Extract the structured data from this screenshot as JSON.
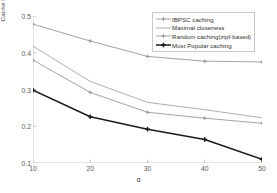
{
  "chart_data": {
    "type": "line",
    "title": "",
    "xlabel": "α",
    "ylabel": "Cache hit ratio",
    "x": [
      10,
      20,
      30,
      40,
      50
    ],
    "xticklabels": [
      "10",
      "20",
      "30",
      "40",
      "50"
    ],
    "yticklabels": [
      "0.1",
      "0.2",
      "0.3",
      "0.4",
      "0.5"
    ],
    "yticks": [
      0.1,
      0.2,
      0.3,
      0.4,
      0.5
    ],
    "xlim": [
      10,
      50
    ],
    "ylim": [
      0.1,
      0.5
    ],
    "grid": false,
    "legend_position": "top-right",
    "series": [
      {
        "name": "IBPSC caching",
        "values": [
          0.478,
          0.432,
          0.39,
          0.377,
          0.375
        ],
        "color": "#8c8c8c",
        "marker": "plus",
        "width": 0.8
      },
      {
        "name": "Maximal closeness",
        "values": [
          0.418,
          0.322,
          0.265,
          0.245,
          0.223
        ],
        "color": "#9a9a9a",
        "marker": "none",
        "width": 0.8
      },
      {
        "name": "Random caching(zipf-based)",
        "values": [
          0.38,
          0.292,
          0.238,
          0.222,
          0.208
        ],
        "color": "#8c8c8c",
        "marker": "plus",
        "width": 0.8
      },
      {
        "name": "Most Popular caching",
        "values": [
          0.298,
          0.226,
          0.192,
          0.164,
          0.11
        ],
        "color": "#1a1a1a",
        "marker": "plus",
        "width": 1.5
      }
    ]
  },
  "axis": {
    "line_color": "#bdbdbd",
    "tick_color": "#5a5a5a"
  }
}
